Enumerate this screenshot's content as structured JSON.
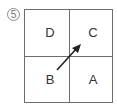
{
  "figure": {
    "number": "5",
    "quadrants": {
      "top_left": "D",
      "top_right": "C",
      "bottom_left": "B",
      "bottom_right": "A"
    },
    "arrow": {
      "from": "B",
      "to": "C"
    },
    "colors": {
      "line": "#6e6e6e",
      "arrow": "#222222",
      "text": "#333333"
    }
  }
}
